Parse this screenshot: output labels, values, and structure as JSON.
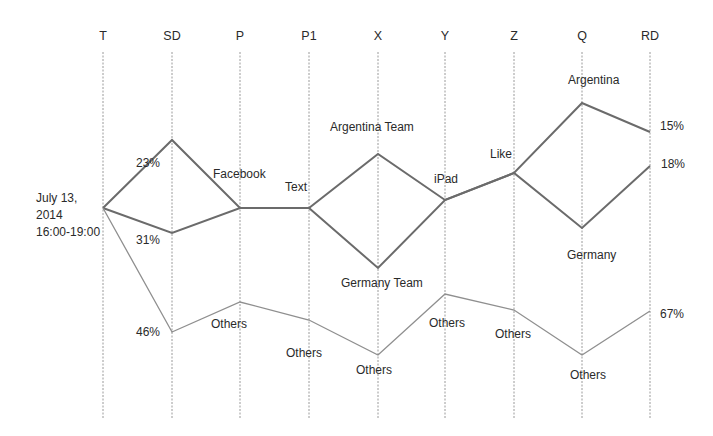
{
  "chart_data": {
    "type": "parallel-coordinates",
    "title": "",
    "axes": [
      "T",
      "SD",
      "P",
      "P1",
      "X",
      "Y",
      "Z",
      "Q",
      "RD"
    ],
    "axis_x": [
      103,
      172,
      240,
      309,
      378,
      445,
      514,
      582,
      650
    ],
    "axis_top": 52,
    "axis_bottom": 418,
    "start_label": [
      "July 13,",
      "2014",
      "16:00-19:00"
    ],
    "series": [
      {
        "name": "Argentina path",
        "stroke": "#6b6b6b",
        "width": 2,
        "points_y": [
          208,
          140,
          208,
          208,
          154,
          200,
          173,
          103,
          132
        ],
        "end_value": "15%"
      },
      {
        "name": "Germany path",
        "stroke": "#6b6b6b",
        "width": 2,
        "points_y": [
          208,
          233,
          208,
          208,
          268,
          200,
          173,
          228,
          166
        ],
        "end_value": "18%"
      },
      {
        "name": "Others path",
        "stroke": "#8f8f8f",
        "width": 1.3,
        "points_y": [
          208,
          332,
          302,
          320,
          355,
          294,
          310,
          355,
          311
        ],
        "end_value": "67%"
      }
    ],
    "shared_segments_note": "Segments P-P1 and Y-Z are shared by Argentina and Germany paths (drawn thicker).",
    "annotations": [
      {
        "id": "sd-top-pct",
        "text": "23%",
        "x": 136,
        "y": 167
      },
      {
        "id": "sd-mid-pct",
        "text": "31%",
        "x": 136,
        "y": 244
      },
      {
        "id": "sd-low-pct",
        "text": "46%",
        "x": 136,
        "y": 336
      },
      {
        "id": "facebook",
        "text": "Facebook",
        "x": 213,
        "y": 178
      },
      {
        "id": "text",
        "text": "Text",
        "x": 285,
        "y": 191
      },
      {
        "id": "argentina-team",
        "text": "Argentina Team",
        "x": 330,
        "y": 131
      },
      {
        "id": "germany-team",
        "text": "Germany Team",
        "x": 341,
        "y": 287
      },
      {
        "id": "ipad",
        "text": "iPad",
        "x": 434,
        "y": 183
      },
      {
        "id": "like",
        "text": "Like",
        "x": 490,
        "y": 158
      },
      {
        "id": "argentina",
        "text": "Argentina",
        "x": 568,
        "y": 84
      },
      {
        "id": "germany",
        "text": "Germany",
        "x": 567,
        "y": 259
      },
      {
        "id": "rd-15",
        "text": "15%",
        "x": 660,
        "y": 130
      },
      {
        "id": "rd-18",
        "text": "18%",
        "x": 661,
        "y": 168
      },
      {
        "id": "rd-67",
        "text": "67%",
        "x": 660,
        "y": 318
      },
      {
        "id": "others-p",
        "text": "Others",
        "x": 211,
        "y": 328
      },
      {
        "id": "others-p1",
        "text": "Others",
        "x": 286,
        "y": 357
      },
      {
        "id": "others-x",
        "text": "Others",
        "x": 356,
        "y": 374
      },
      {
        "id": "others-y",
        "text": "Others",
        "x": 429,
        "y": 327
      },
      {
        "id": "others-z",
        "text": "Others",
        "x": 495,
        "y": 338
      },
      {
        "id": "others-q",
        "text": "Others",
        "x": 570,
        "y": 379
      }
    ],
    "grid": false,
    "legend": null
  }
}
